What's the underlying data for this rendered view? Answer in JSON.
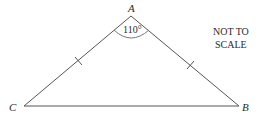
{
  "diagram": {
    "type": "isosceles-triangle",
    "vertices": {
      "A": {
        "label": "A",
        "x": 131,
        "y": 16
      },
      "B": {
        "label": "B",
        "x": 239,
        "y": 106
      },
      "C": {
        "label": "C",
        "x": 24,
        "y": 106
      }
    },
    "angle_A": {
      "label": "110°",
      "value": 110
    },
    "equal_sides": [
      "AC",
      "AB"
    ],
    "note": {
      "line1": "NOT TO",
      "line2": "SCALE"
    },
    "colors": {
      "line": "#555555",
      "text": "#2a2a2a"
    }
  }
}
